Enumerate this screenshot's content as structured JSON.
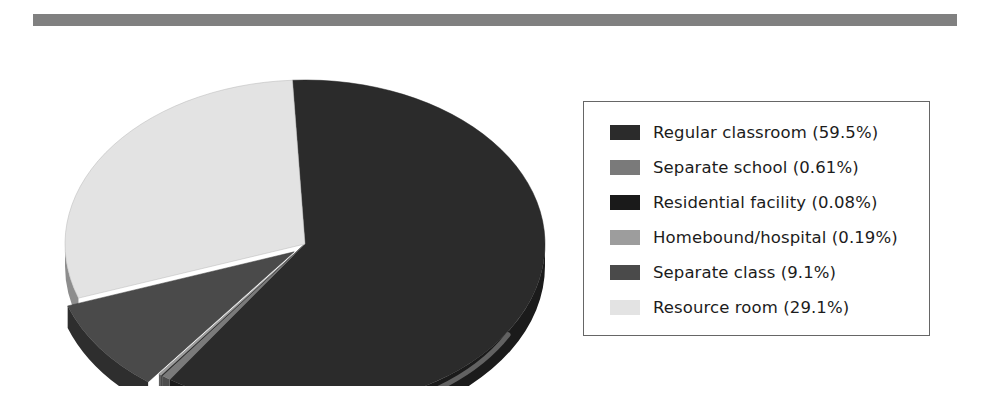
{
  "page": {
    "background_color": "#ffffff",
    "width": 988,
    "height": 397
  },
  "top_bar": {
    "name": "horizontal-rule",
    "color": "#808080"
  },
  "legend": {
    "border_color": "#666666",
    "background_color": "#ffffff",
    "position": "right",
    "entries": [
      {
        "label": "Regular classroom (59.5%)",
        "swatch_color": "#2b2b2b",
        "category": "Regular classroom",
        "percent": 59.5
      },
      {
        "label": "Separate school (0.61%)",
        "swatch_color": "#7a7a7a",
        "category": "Separate school",
        "percent": 0.61
      },
      {
        "label": "Residential facility (0.08%)",
        "swatch_color": "#1a1a1a",
        "category": "Residential facility",
        "percent": 0.08
      },
      {
        "label": "Homebound/hospital (0.19%)",
        "swatch_color": "#9d9d9d",
        "category": "Homebound/hospital",
        "percent": 0.19
      },
      {
        "label": "Separate class (9.1%)",
        "swatch_color": "#4a4a4a",
        "category": "Separate class",
        "percent": 9.1
      },
      {
        "label": "Resource room (29.1%)",
        "swatch_color": "#e3e3e3",
        "category": "Resource room",
        "percent": 29.1
      }
    ]
  },
  "chart_data": {
    "type": "pie",
    "title": "",
    "subtitle": "",
    "xlabel": "",
    "ylabel": "",
    "style": "3d-exploded",
    "legend_position": "right",
    "grid": false,
    "total_percent": 98.58,
    "categories": [
      "Regular classroom",
      "Separate school",
      "Residential facility",
      "Homebound/hospital",
      "Separate class",
      "Resource room"
    ],
    "values": [
      59.5,
      0.61,
      0.08,
      0.19,
      9.1,
      29.1
    ],
    "labels": [
      "Regular classroom (59.5%)",
      "Separate school (0.61%)",
      "Residential facility (0.08%)",
      "Homebound/hospital (0.19%)",
      "Separate class (9.1%)",
      "Resource room (29.1%)"
    ],
    "colors": [
      "#2b2b2b",
      "#7a7a7a",
      "#1a1a1a",
      "#9d9d9d",
      "#4a4a4a",
      "#e3e3e3"
    ],
    "exploded_slices": [
      "Separate class"
    ],
    "annotations": []
  }
}
